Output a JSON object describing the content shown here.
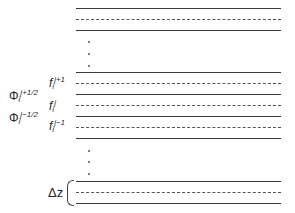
{
  "diagram": {
    "lines": [
      {
        "y": 8,
        "style": "solid"
      },
      {
        "y": 19,
        "style": "dashed"
      },
      {
        "y": 30,
        "style": "solid"
      },
      {
        "y": 72,
        "style": "solid"
      },
      {
        "y": 83,
        "style": "dashed"
      },
      {
        "y": 94,
        "style": "solid"
      },
      {
        "y": 105,
        "style": "dashed"
      },
      {
        "y": 116,
        "style": "solid"
      },
      {
        "y": 127,
        "style": "dashed"
      },
      {
        "y": 138,
        "style": "solid"
      },
      {
        "y": 181,
        "style": "solid"
      },
      {
        "y": 192,
        "style": "dashed"
      },
      {
        "y": 203,
        "style": "solid"
      }
    ],
    "labels": {
      "f_upper": {
        "base": "f",
        "sub": "i",
        "sup": "j+1"
      },
      "phi_upper": {
        "base": "Φ",
        "sub": "i",
        "sup": "j+1/2"
      },
      "f_mid": {
        "base": "f",
        "sub": "i",
        "sup": "j"
      },
      "phi_lower": {
        "base": "Φ",
        "sub": "i",
        "sup": "j−1/2"
      },
      "f_lower": {
        "base": "f",
        "sub": "i",
        "sup": "j−1"
      },
      "delta_z": "Δz"
    },
    "ellipsis": "⋮"
  }
}
